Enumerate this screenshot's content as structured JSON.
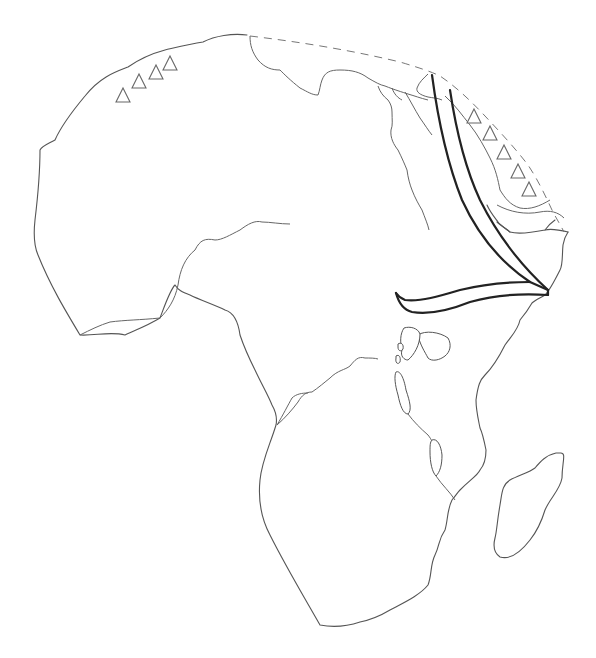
{
  "map": {
    "subject": "Outline map of Africa",
    "colors": {
      "background": "#ffffff",
      "coastline": "#555555",
      "dashed_boundary": "#777777",
      "arrow_bands": "#222222",
      "triangle_outline": "#666666"
    },
    "markers": {
      "northwest_triangles": {
        "count": 4,
        "icon": "triangle-outline"
      },
      "northeast_triangles": {
        "count": 5,
        "icon": "triangle-outline"
      }
    },
    "features": [
      "dashed-northern-boundary",
      "double-line-arrow-band-east",
      "rift-valley-lakes",
      "madagascar-island"
    ]
  }
}
